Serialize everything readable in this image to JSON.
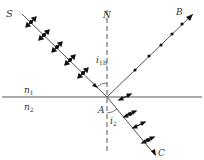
{
  "diagram": {
    "labels": {
      "source": "S",
      "normal": "N",
      "reflected": "B",
      "refracted": "C",
      "incidence_point": "A",
      "medium_top": "n",
      "medium_top_sub": "1",
      "medium_bottom": "n",
      "medium_bottom_sub": "2",
      "angle_incident": "i",
      "angle_incident_sub": "1B",
      "angle_refracted": "i",
      "angle_refracted_sub": "2"
    },
    "colors": {
      "line": "#555555",
      "marker": "#111111",
      "text": "#333333"
    },
    "rays": [
      {
        "name": "incident",
        "from": "S",
        "to": "A",
        "polarization": "dots and double arrows"
      },
      {
        "name": "reflected",
        "from": "A",
        "to": "B",
        "polarization": "dots only"
      },
      {
        "name": "refracted",
        "from": "A",
        "to": "C",
        "polarization": "double arrows with dots"
      }
    ]
  }
}
